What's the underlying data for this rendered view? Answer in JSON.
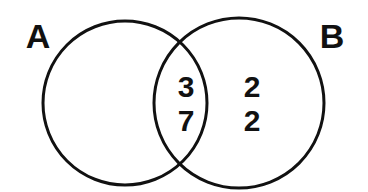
{
  "diagram": {
    "type": "venn",
    "background_color": "#ffffff",
    "stroke_color": "#111111",
    "text_color": "#111111",
    "stroke_width": 3,
    "sets": [
      {
        "id": "A",
        "label": "A",
        "label_x": 38,
        "label_y": 38,
        "center_x": 125,
        "center_y": 103,
        "radius": 82
      },
      {
        "id": "B",
        "label": "B",
        "label_x": 332,
        "label_y": 38,
        "center_x": 239,
        "center_y": 103,
        "radius": 85
      }
    ],
    "regions": [
      {
        "id": "a-only",
        "name": "A only",
        "values": [],
        "center_x": 108,
        "center_y": 103
      },
      {
        "id": "intersection",
        "name": "A intersect B",
        "values": [
          "3",
          "7"
        ],
        "center_x": 186,
        "center_y": 103
      },
      {
        "id": "b-only",
        "name": "B only",
        "values": [
          "2",
          "2"
        ],
        "center_x": 252,
        "center_y": 103
      }
    ],
    "labels": {
      "intersection_top": "3",
      "intersection_bottom": "7",
      "b_only_top": "2",
      "b_only_bottom": "2",
      "set_a": "A",
      "set_b": "B"
    }
  }
}
